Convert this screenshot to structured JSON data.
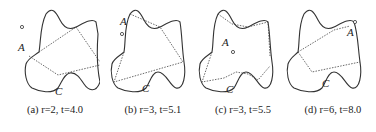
{
  "figure": {
    "panels": [
      {
        "id": "a",
        "caption": "(a) r=2, t=4.0",
        "labels": {
          "agent": "A",
          "corner": "C"
        }
      },
      {
        "id": "b",
        "caption": "(b) r=3, t=5.1",
        "labels": {
          "agent": "A",
          "corner": "C"
        }
      },
      {
        "id": "c",
        "caption": "(c) r=3, t=5.5",
        "labels": {
          "agent": "A",
          "corner": "C"
        }
      },
      {
        "id": "d",
        "caption": "(d) r=6, t=8.0",
        "labels": {
          "agent": "A",
          "corner": "C"
        }
      }
    ],
    "colors": {
      "stroke": "#333333",
      "background": "#ffffff"
    }
  }
}
